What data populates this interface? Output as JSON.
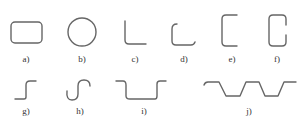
{
  "figure": {
    "stroke_color": "#666666",
    "shapes": [
      {
        "id": "a",
        "label": "a)",
        "shape": "rounded rectangle"
      },
      {
        "id": "b",
        "label": "b)",
        "shape": "circle"
      },
      {
        "id": "c",
        "label": "c)",
        "shape": "L-bend"
      },
      {
        "id": "d",
        "label": "d)",
        "shape": "hook with inward lip"
      },
      {
        "id": "e",
        "label": "e)",
        "shape": "square bracket"
      },
      {
        "id": "f",
        "label": "f)",
        "shape": "C-channel rounded"
      },
      {
        "id": "g",
        "label": "g)",
        "shape": "Z-step"
      },
      {
        "id": "h",
        "label": "h)",
        "shape": "S-curve"
      },
      {
        "id": "i",
        "label": "i)",
        "shape": "hat/channel step"
      },
      {
        "id": "j",
        "label": "j)",
        "shape": "trapezoidal corrugation"
      }
    ]
  }
}
